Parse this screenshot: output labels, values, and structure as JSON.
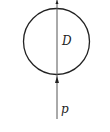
{
  "diagram": {
    "circle_label": "D",
    "force_label": "p",
    "colors": {
      "stroke": "#222222",
      "axis": "#555555"
    }
  }
}
